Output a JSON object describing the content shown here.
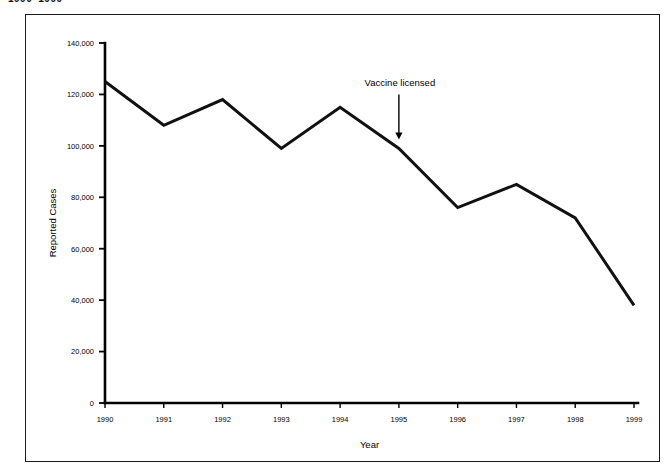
{
  "page": {
    "clipped_header": "1990–1999"
  },
  "chart_data": {
    "type": "line",
    "title": "",
    "subtitle": "",
    "xlabel": "Year",
    "ylabel": "Reported Cases",
    "categories": [
      "1990",
      "1991",
      "1992",
      "1993",
      "1994",
      "1995",
      "1996",
      "1997",
      "1998",
      "1999"
    ],
    "x": [
      1990,
      1991,
      1992,
      1993,
      1994,
      1995,
      1996,
      1997,
      1998,
      1999
    ],
    "values": [
      125000,
      108000,
      118000,
      99000,
      115000,
      99000,
      76000,
      85000,
      72000,
      38000
    ],
    "series": [
      {
        "name": "Reported Cases",
        "values": [
          125000,
          108000,
          118000,
          99000,
          115000,
          99000,
          76000,
          85000,
          72000,
          38000
        ],
        "color": "#111111"
      }
    ],
    "ylim": [
      0,
      140000
    ],
    "xlim": [
      1990,
      1999
    ],
    "ytick_values": [
      0,
      20000,
      40000,
      60000,
      80000,
      100000,
      120000,
      140000
    ],
    "ytick_labels": [
      "0",
      "20,000",
      "40,000",
      "60,000",
      "80,000",
      "100,000",
      "120,000",
      "140,000"
    ],
    "xtick_labels": [
      "1990",
      "1991",
      "1992",
      "1993",
      "1994",
      "1995",
      "1996",
      "1997",
      "1998",
      "1999"
    ],
    "grid": false,
    "legend": null,
    "legend_position": "none",
    "annotations": [
      {
        "text": "Vaccine licensed",
        "x": 1995,
        "arrow": "down",
        "arrow_target_value": 99000
      }
    ]
  }
}
